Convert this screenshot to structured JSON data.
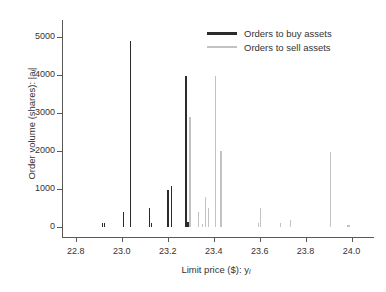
{
  "chart_data": {
    "type": "bar",
    "title": "",
    "subtitle": "",
    "xlabel": "Limit price ($): y",
    "xlabel_sub": "i",
    "ylabel": "Order volume (shares): |a",
    "ylabel_sub": "i",
    "ylabel_tail": "|",
    "xlim": [
      22.74,
      24.08
    ],
    "ylim": [
      0,
      5400
    ],
    "grid": false,
    "legend_position": "top-right",
    "xticks": [
      22.8,
      23.0,
      23.2,
      23.4,
      23.6,
      23.8,
      24.0
    ],
    "xticklabels": [
      "22.8",
      "23.0",
      "23.2",
      "23.4",
      "23.6",
      "23.8",
      "24.0"
    ],
    "yticks": [
      0,
      1000,
      2000,
      3000,
      4000,
      5000
    ],
    "yticklabels": [
      "0",
      "1000",
      "2000",
      "3000",
      "4000",
      "5000"
    ],
    "colors": {
      "buy": "#2b2b2b",
      "sell": "#c2c2c2",
      "axis": "#595959",
      "text": "#333333",
      "background": "#ffffff"
    },
    "series": [
      {
        "name": "Orders to buy assets",
        "color": "#2b2b2b",
        "points": [
          {
            "x": 22.912,
            "y": 100
          },
          {
            "x": 22.921,
            "y": 100
          },
          {
            "x": 23.005,
            "y": 400
          },
          {
            "x": 23.035,
            "y": 4900
          },
          {
            "x": 23.118,
            "y": 500
          },
          {
            "x": 23.127,
            "y": 100
          },
          {
            "x": 23.198,
            "y": 980
          },
          {
            "x": 23.214,
            "y": 1090
          },
          {
            "x": 23.277,
            "y": 3980
          },
          {
            "x": 23.285,
            "y": 130
          },
          {
            "x": 23.29,
            "y": 110
          }
        ]
      },
      {
        "name": "Orders to sell assets",
        "color": "#c2c2c2",
        "points": [
          {
            "x": 23.294,
            "y": 2890
          },
          {
            "x": 23.332,
            "y": 390
          },
          {
            "x": 23.347,
            "y": 80
          },
          {
            "x": 23.36,
            "y": 800
          },
          {
            "x": 23.374,
            "y": 500
          },
          {
            "x": 23.404,
            "y": 3980
          },
          {
            "x": 23.428,
            "y": 2000
          },
          {
            "x": 23.592,
            "y": 100
          },
          {
            "x": 23.6,
            "y": 500
          },
          {
            "x": 23.688,
            "y": 100
          },
          {
            "x": 23.73,
            "y": 180
          },
          {
            "x": 23.905,
            "y": 1980
          },
          {
            "x": 23.978,
            "y": 60
          },
          {
            "x": 23.986,
            "y": 60
          }
        ]
      }
    ]
  },
  "legend": {
    "items": [
      {
        "label": "Orders to buy assets",
        "key": "buy"
      },
      {
        "label": "Orders to sell assets",
        "key": "sell"
      }
    ]
  }
}
